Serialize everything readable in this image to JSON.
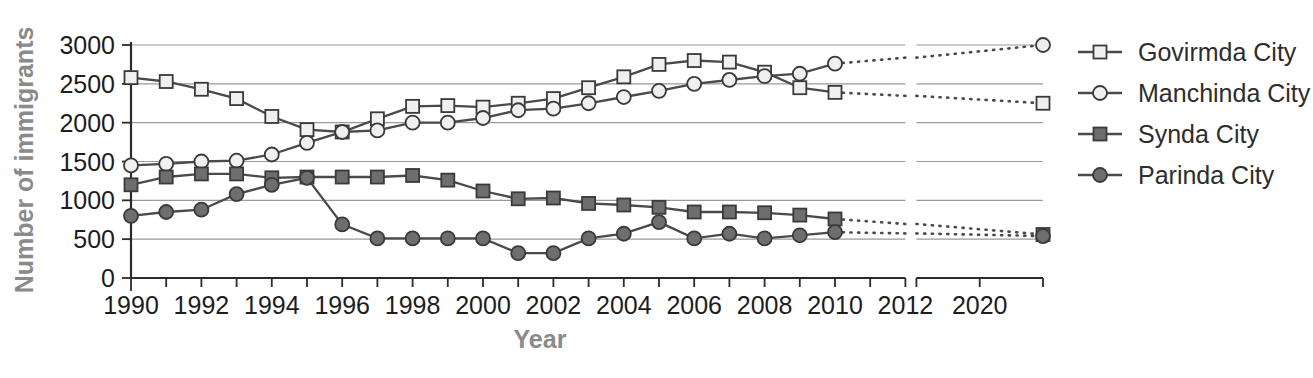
{
  "chart_data": {
    "type": "line",
    "title": "",
    "xlabel": "Year",
    "ylabel": "Number of immigrants",
    "ylim": [
      0,
      3000
    ],
    "yticks": [
      0,
      500,
      1000,
      1500,
      2000,
      2500,
      3000
    ],
    "ytick_labels": [
      "0",
      "500",
      "1000",
      "1500",
      "2000",
      "2500",
      "3000"
    ],
    "grid": true,
    "legend_position": "right",
    "axis_break": {
      "present": true,
      "main_range": [
        1990,
        2012
      ],
      "secondary_range": [
        2019,
        2021
      ],
      "note": "x-axis is broken between 2012 and 2019"
    },
    "x": [
      1990,
      1991,
      1992,
      1993,
      1994,
      1995,
      1996,
      1997,
      1998,
      1999,
      2000,
      2001,
      2002,
      2003,
      2004,
      2005,
      2006,
      2007,
      2008,
      2009,
      2010
    ],
    "xticks": [
      1990,
      1991,
      1992,
      1993,
      1994,
      1995,
      1996,
      1997,
      1998,
      1999,
      2000,
      2001,
      2002,
      2003,
      2004,
      2005,
      2006,
      2007,
      2008,
      2009,
      2010,
      2011,
      2012
    ],
    "xtick_labels_shown": [
      "1990",
      "1992",
      "1994",
      "1996",
      "1998",
      "2000",
      "2002",
      "2004",
      "2006",
      "2008",
      "2010",
      "2012",
      "2020"
    ],
    "projection_x": [
      2010,
      2021
    ],
    "series": [
      {
        "name": "Govirmda City",
        "marker": "open-square",
        "values": [
          2580,
          2530,
          2430,
          2310,
          2080,
          1910,
          1880,
          2050,
          2210,
          2220,
          2200,
          2250,
          2310,
          2450,
          2590,
          2750,
          2800,
          2780,
          2650,
          2450,
          2390
        ],
        "projection": [
          2390,
          2250
        ]
      },
      {
        "name": "Manchinda City",
        "marker": "open-circle",
        "values": [
          1450,
          1470,
          1500,
          1510,
          1590,
          1740,
          1880,
          1900,
          2000,
          2000,
          2060,
          2160,
          2180,
          2250,
          2330,
          2410,
          2500,
          2550,
          2600,
          2630,
          2760
        ],
        "projection": [
          2760,
          3000
        ]
      },
      {
        "name": "Synda City",
        "marker": "filled-square",
        "values": [
          1200,
          1300,
          1340,
          1340,
          1290,
          1300,
          1300,
          1300,
          1320,
          1260,
          1120,
          1020,
          1030,
          960,
          940,
          910,
          850,
          850,
          840,
          810,
          760
        ],
        "projection": [
          760,
          560
        ]
      },
      {
        "name": "Parinda City",
        "marker": "filled-circle",
        "values": [
          800,
          850,
          880,
          1080,
          1200,
          1290,
          690,
          510,
          510,
          510,
          510,
          320,
          320,
          510,
          570,
          720,
          510,
          570,
          510,
          550,
          590
        ],
        "projection": [
          590,
          540
        ]
      }
    ]
  },
  "axis": {
    "xlabel": "Year",
    "ylabel": "Number of immigrants"
  },
  "legend": {
    "items": [
      {
        "label": "Govirmda City"
      },
      {
        "label": "Manchinda City"
      },
      {
        "label": "Synda City"
      },
      {
        "label": "Parinda City"
      }
    ]
  },
  "colors": {
    "line": "#4a4a4a",
    "marker_open": "#f0f0f0",
    "marker_filled": "#6e6e6e",
    "marker_edge": "#3a3a3a",
    "grid": "#9a9a9a",
    "axis": "#2b2b2b",
    "tick_text": "#1d1d1d",
    "axis_title": "#8a8a8a"
  }
}
